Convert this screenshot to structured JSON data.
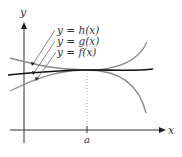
{
  "figure": {
    "axis_labels": {
      "x": "x",
      "y": "y"
    },
    "tick_labels": {
      "a": "a"
    },
    "curve_labels": {
      "h": "y = h(x)",
      "g": "y = g(x)",
      "f": "y = f(x)"
    },
    "colors": {
      "axis": "#333333",
      "h_curve": "#8a8a8a",
      "g_curve": "#111111",
      "f_curve": "#8a8a8a",
      "dotted": "#999999"
    }
  }
}
